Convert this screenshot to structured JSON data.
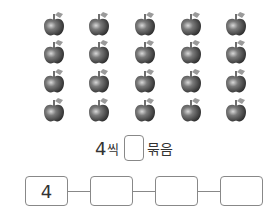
{
  "apples": {
    "rows": 4,
    "cols": 5,
    "count": 20,
    "col_x": [
      43,
      88,
      134,
      180,
      225
    ],
    "row_y": [
      12,
      40,
      69,
      98
    ]
  },
  "sentence": {
    "number": "4",
    "unit": "씩",
    "blank": "",
    "word": "묶음"
  },
  "chain": {
    "boxes": [
      {
        "value": "4"
      },
      {
        "value": ""
      },
      {
        "value": ""
      },
      {
        "value": ""
      }
    ]
  }
}
